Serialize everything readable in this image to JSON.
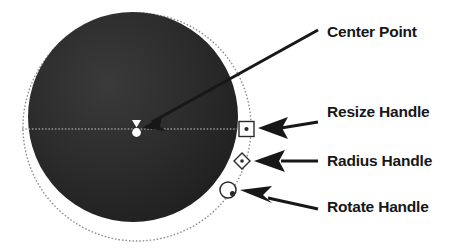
{
  "figure": {
    "background": "#ffffff",
    "ink_color": "#171717",
    "outline_color": "#8a8a8a",
    "fill_color": "#262626",
    "handle_fill": "#ffffff",
    "canvas": {
      "width": 464,
      "height": 250
    }
  },
  "shapes": {
    "filled_circle": {
      "name": "filled-circle",
      "cx": 133,
      "cy": 117,
      "r": 105,
      "fill": "#262626"
    },
    "outline_circle": {
      "name": "outline-circle",
      "cx": 137,
      "cy": 127,
      "r": 114,
      "stroke": "#8a8a8a",
      "dashed": true
    },
    "radius_line": {
      "name": "radius-guide-line",
      "x1": 22,
      "y1": 129,
      "x2": 246,
      "y2": 129,
      "dashed": true
    }
  },
  "markers": [
    {
      "id": "center-point",
      "shape": "bowtie-dot",
      "label": "Center Point",
      "x": 136,
      "y": 129
    },
    {
      "id": "resize-handle",
      "shape": "square",
      "label": "Resize Handle",
      "x": 246,
      "y": 129
    },
    {
      "id": "radius-handle",
      "shape": "diamond",
      "label": "Radius Handle",
      "x": 242,
      "y": 161
    },
    {
      "id": "rotate-handle",
      "shape": "circle",
      "label": "Rotate Handle",
      "x": 228,
      "y": 190
    }
  ],
  "labels": {
    "center_point": "Center Point",
    "resize_handle": "Resize Handle",
    "radius_handle": "Radius Handle",
    "rotate_handle": "Rotate Handle"
  },
  "callouts": [
    {
      "id": "callout-center-point",
      "target": "center-point",
      "from_x": 318,
      "from_y": 30,
      "to_x": 145,
      "to_y": 125
    },
    {
      "id": "callout-resize-handle",
      "target": "resize-handle",
      "from_x": 318,
      "from_y": 122,
      "to_x": 258,
      "to_y": 128
    },
    {
      "id": "callout-radius-handle",
      "target": "radius-handle",
      "from_x": 318,
      "from_y": 161,
      "to_x": 254,
      "to_y": 161
    },
    {
      "id": "callout-rotate-handle",
      "target": "rotate-handle",
      "from_x": 318,
      "from_y": 209,
      "to_x": 240,
      "to_y": 190
    }
  ]
}
